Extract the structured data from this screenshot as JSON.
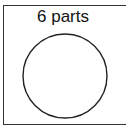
{
  "diagram": {
    "label": "6 parts",
    "shape": "circle",
    "colors": {
      "stroke": "#222222",
      "background": "#ffffff"
    }
  }
}
